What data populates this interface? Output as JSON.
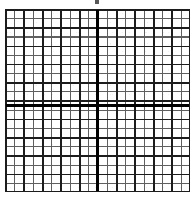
{
  "figure": {
    "kind": "graph-paper-grid",
    "title": "",
    "background_color": "#ffffff",
    "width_px": 194,
    "height_px": 197
  },
  "marks": {
    "top_mark": {
      "name": "top-artifact-mark",
      "label": "",
      "color": "#3a3a3a",
      "x_px": 95,
      "y_px": 0,
      "width_px": 4,
      "height_px": 4
    }
  },
  "grid": {
    "left_px": 5,
    "top_px": 9,
    "width_px": 185,
    "height_px": 183,
    "minor_cols": 20,
    "minor_rows": 20,
    "minor_spacing_x_px": 9.25,
    "minor_spacing_y_px": 9.15,
    "major_every_n_minor": 2,
    "major_cols": 10,
    "major_rows": 10,
    "minor_line_color": "#5f5f5f",
    "major_line_color": "#1c1c1c",
    "border_color": "#1c1c1c",
    "minor_line_width_px": 1.1,
    "major_line_width_px": 1.6,
    "border_width_px": 1.6
  },
  "axes": {
    "x_axis": {
      "label": "",
      "orientation": "horizontal",
      "color": "#000000",
      "thickness_px": 2.8,
      "position_from_grid_top_px": 95,
      "position_in_image_px": 104
    },
    "y_axis": {
      "label": "",
      "orientation": "vertical",
      "color": "#000000",
      "thickness_px": 2.8,
      "position_from_grid_left_px": 91,
      "position_in_image_px": 96
    },
    "origin": {
      "label": "",
      "x_px": 96,
      "y_px": 104
    }
  },
  "chart_data": {
    "type": "table",
    "title": "",
    "xlabel": "",
    "ylabel": "",
    "grid": true,
    "legend": null,
    "series": [],
    "categories": [],
    "values": [],
    "xlim": [
      -10,
      10
    ],
    "ylim": [
      -10,
      10
    ],
    "xticks": [
      -10,
      -9,
      -8,
      -7,
      -6,
      -5,
      -4,
      -3,
      -2,
      -1,
      0,
      1,
      2,
      3,
      4,
      5,
      6,
      7,
      8,
      9,
      10
    ],
    "yticks": [
      -10,
      -9,
      -8,
      -7,
      -6,
      -5,
      -4,
      -3,
      -2,
      -1,
      0,
      1,
      2,
      3,
      4,
      5,
      6,
      7,
      8,
      9,
      10
    ],
    "xticklabels": [],
    "yticklabels": [],
    "annotations": [],
    "note": "Blank Cartesian graph paper: 20x20 minor squares, heavy axes through the centre, no plotted data."
  }
}
